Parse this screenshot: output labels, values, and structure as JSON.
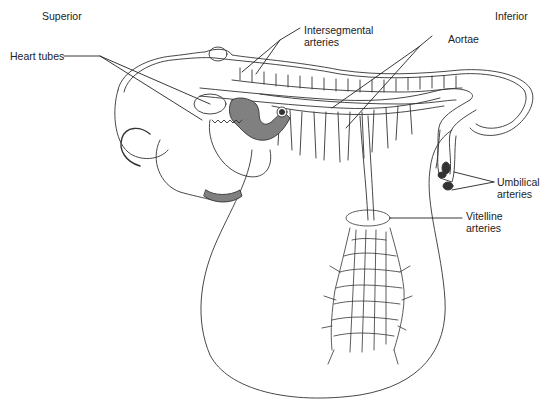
{
  "figure": {
    "orientation": {
      "left": "Superior",
      "right": "Inferior"
    },
    "labels": [
      {
        "id": "heart-tubes",
        "lines": [
          "Heart tubes"
        ]
      },
      {
        "id": "intersegmental-arteries",
        "lines": [
          "Intersegmental",
          "arteries"
        ]
      },
      {
        "id": "aortae",
        "lines": [
          "Aortae"
        ]
      },
      {
        "id": "umbilical-arteries",
        "lines": [
          "Umbilical",
          "arteries"
        ]
      },
      {
        "id": "vitelline-arteries",
        "lines": [
          "Vitelline",
          "arteries"
        ]
      }
    ],
    "colors": {
      "line": "#333333",
      "fill_shaded": "#808080",
      "fill_dark": "#333333",
      "background": "#ffffff"
    }
  }
}
